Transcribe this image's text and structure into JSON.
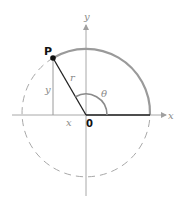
{
  "diagram": {
    "labels": {
      "point": "P",
      "origin": "0",
      "radius": "r",
      "angle": "θ",
      "x_axis": "x",
      "y_axis": "y",
      "x_leg": "x",
      "y_leg": "y"
    },
    "colors": {
      "arc_solid": "#9a9a9a",
      "circle_dashed": "#a8a8a8",
      "axes": "#a0a0a0",
      "radius_line": "#222222",
      "point_fill": "#111111",
      "angle_arc": "#8a8a8a",
      "leg_line": "#9a9a9a"
    },
    "geometry": {
      "origin": [
        86,
        115
      ],
      "radius": 64,
      "point_P": [
        53,
        58
      ],
      "angle_degrees": 120
    }
  }
}
